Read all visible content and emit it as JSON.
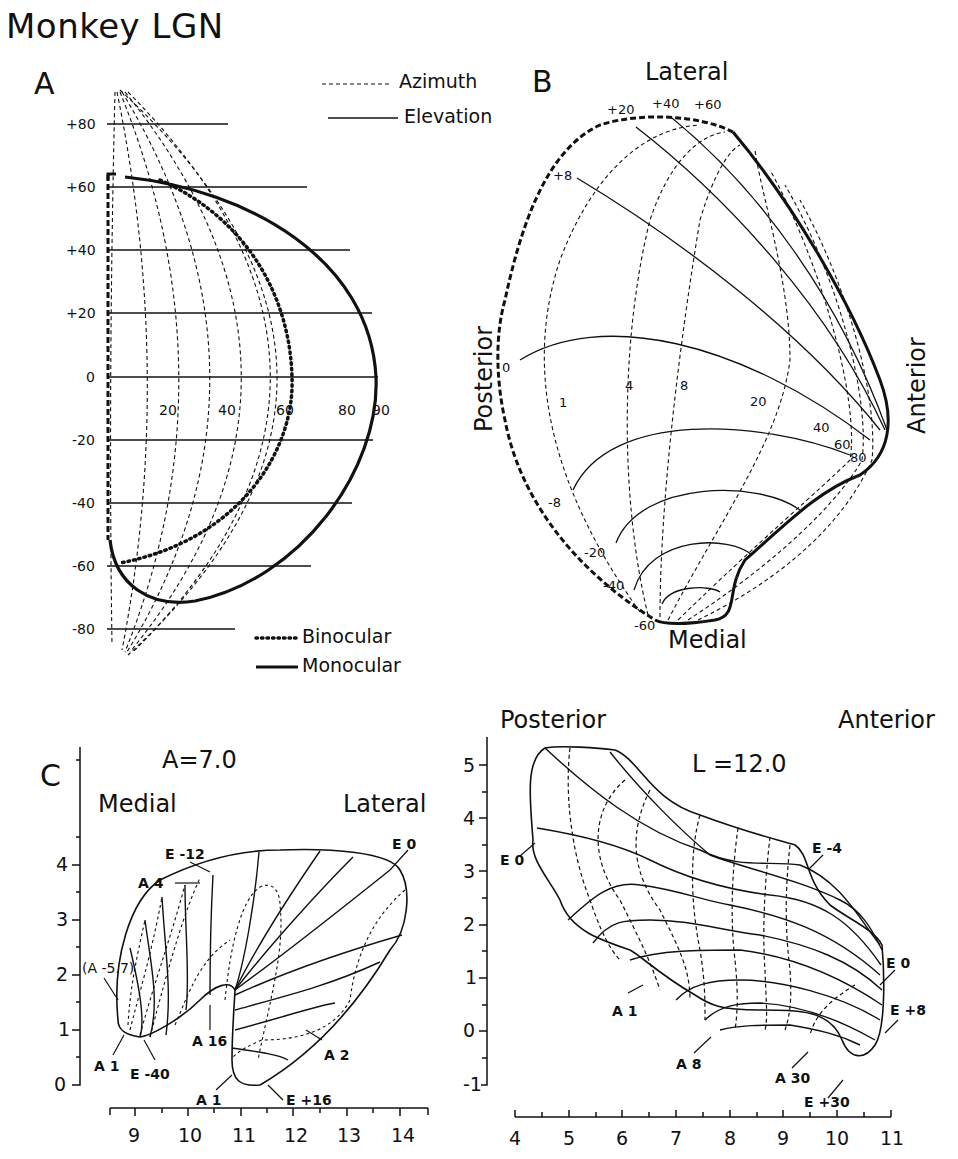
{
  "figure": {
    "title": "Monkey LGN"
  },
  "panel_a": {
    "letter": "A",
    "legend_lines": {
      "azimuth": "Azimuth",
      "elevation": "Elevation"
    },
    "legend_fields": {
      "binocular": "Binocular",
      "monocular": "Monocular"
    },
    "elevation_ticks": [
      "+80",
      "+60",
      "+40",
      "+20",
      "0",
      "-20",
      "-40",
      "-60",
      "-80"
    ],
    "azimuth_ticks": [
      "20",
      "40",
      "60",
      "80",
      "90"
    ]
  },
  "panel_b": {
    "letter": "B",
    "orientation": {
      "top": "Lateral",
      "bottom": "Medial",
      "left": "Posterior",
      "right": "Anterior"
    },
    "elevation_labels": [
      "+20",
      "+40",
      "+60",
      "+8",
      "0",
      "-8",
      "-20",
      "-40",
      "-60"
    ],
    "azimuth_labels": [
      "1",
      "4",
      "8",
      "20",
      "40",
      "60",
      "80"
    ]
  },
  "panel_c": {
    "letter": "C",
    "left": {
      "section": "A=7.0",
      "orientation": {
        "left": "Medial",
        "right": "Lateral"
      },
      "y_ticks": [
        "4",
        "3",
        "2",
        "1",
        "0"
      ],
      "x_ticks": [
        "9",
        "10",
        "11",
        "12",
        "13",
        "14"
      ],
      "annotations": [
        "E -12",
        "A 4",
        "(A -5.7)",
        "A 1",
        "E -40",
        "A 16",
        "A 2",
        "A 1",
        "E +16",
        "E 0"
      ]
    },
    "right": {
      "section": "L =12.0",
      "orientation": {
        "left": "Posterior",
        "right": "Anterior"
      },
      "y_ticks": [
        "5",
        "4",
        "3",
        "2",
        "1",
        "0",
        "-1"
      ],
      "x_ticks": [
        "4",
        "5",
        "6",
        "7",
        "8",
        "9",
        "10",
        "11"
      ],
      "annotations": [
        "E 0",
        "E -4",
        "A 1",
        "A 8",
        "E 0",
        "E +8",
        "A 30",
        "E +30"
      ]
    }
  }
}
